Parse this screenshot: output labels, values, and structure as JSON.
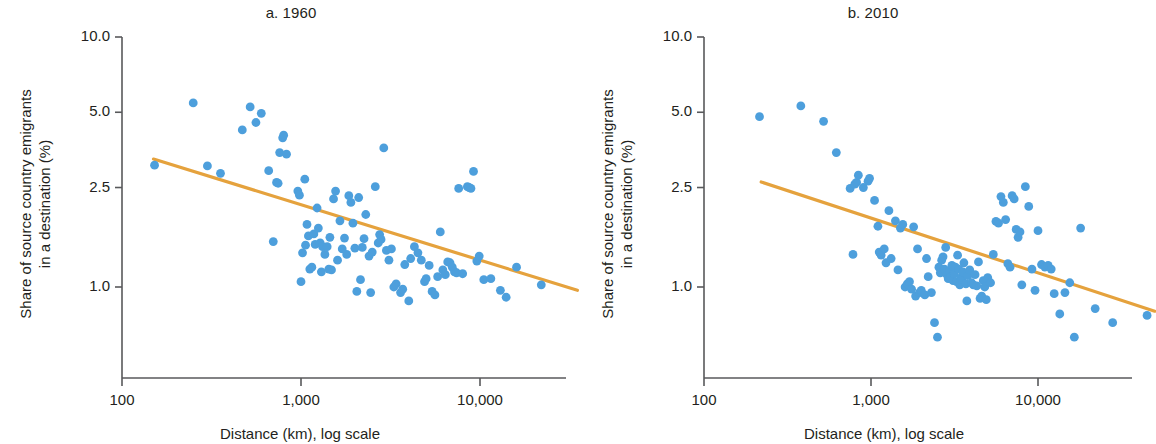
{
  "figure": {
    "background": "#ffffff",
    "point_color": "#4d9fdc",
    "line_color": "#e5a23d",
    "axis_color": "#58595b",
    "text_color": "#231f20"
  },
  "chart_data": [
    {
      "type": "scatter",
      "title": "a. 1960",
      "xlabel": "Distance (km), log scale",
      "ylabel": "Share of source country emigrants in a destination (%)",
      "ylabel_lines": [
        "Share of source country emigrants",
        "in a destination (%)"
      ],
      "xscale": "log",
      "yscale": "log",
      "xlim": [
        100,
        40000
      ],
      "ylim": [
        0.55,
        10.0
      ],
      "xticks": [
        100,
        1000,
        10000
      ],
      "xticklabels": [
        "100",
        "1,000",
        "10,000"
      ],
      "yticks": [
        1.0,
        2.5,
        5.0,
        10.0
      ],
      "yticklabels": [
        "1.0",
        "2.5",
        "5.0",
        "10.0"
      ],
      "grid": false,
      "legend": "none",
      "trendline": {
        "x": [
          150,
          35000
        ],
        "y": [
          3.25,
          0.97
        ]
      },
      "points": [
        [
          152,
          3.07
        ],
        [
          250,
          5.45
        ],
        [
          300,
          3.05
        ],
        [
          355,
          2.85
        ],
        [
          470,
          4.25
        ],
        [
          520,
          5.25
        ],
        [
          560,
          4.55
        ],
        [
          600,
          4.95
        ],
        [
          660,
          2.92
        ],
        [
          700,
          1.52
        ],
        [
          730,
          2.62
        ],
        [
          745,
          2.6
        ],
        [
          760,
          3.45
        ],
        [
          790,
          3.95
        ],
        [
          800,
          4.05
        ],
        [
          830,
          3.4
        ],
        [
          960,
          2.42
        ],
        [
          980,
          2.33
        ],
        [
          1000,
          1.05
        ],
        [
          1020,
          1.37
        ],
        [
          1050,
          2.7
        ],
        [
          1060,
          1.47
        ],
        [
          1080,
          1.78
        ],
        [
          1100,
          1.6
        ],
        [
          1120,
          1.18
        ],
        [
          1150,
          1.2
        ],
        [
          1180,
          1.63
        ],
        [
          1200,
          1.48
        ],
        [
          1230,
          2.07
        ],
        [
          1250,
          1.72
        ],
        [
          1280,
          1.5
        ],
        [
          1300,
          1.15
        ],
        [
          1320,
          1.45
        ],
        [
          1360,
          1.35
        ],
        [
          1400,
          1.45
        ],
        [
          1430,
          1.18
        ],
        [
          1450,
          1.58
        ],
        [
          1480,
          1.17
        ],
        [
          1520,
          2.25
        ],
        [
          1560,
          2.42
        ],
        [
          1600,
          1.28
        ],
        [
          1650,
          1.84
        ],
        [
          1700,
          1.42
        ],
        [
          1750,
          1.57
        ],
        [
          1800,
          1.35
        ],
        [
          1850,
          2.32
        ],
        [
          1900,
          2.18
        ],
        [
          1950,
          1.8
        ],
        [
          2000,
          1.43
        ],
        [
          2050,
          0.96
        ],
        [
          2100,
          2.28
        ],
        [
          2150,
          1.07
        ],
        [
          2200,
          1.44
        ],
        [
          2250,
          1.56
        ],
        [
          2300,
          1.95
        ],
        [
          2400,
          1.33
        ],
        [
          2450,
          0.95
        ],
        [
          2500,
          1.38
        ],
        [
          2600,
          2.52
        ],
        [
          2700,
          1.5
        ],
        [
          2750,
          1.62
        ],
        [
          2800,
          1.55
        ],
        [
          2900,
          3.6
        ],
        [
          3000,
          1.4
        ],
        [
          3100,
          1.28
        ],
        [
          3200,
          1.42
        ],
        [
          3300,
          1.0
        ],
        [
          3400,
          1.03
        ],
        [
          3600,
          0.95
        ],
        [
          3700,
          0.98
        ],
        [
          3800,
          1.23
        ],
        [
          4000,
          0.88
        ],
        [
          4100,
          1.3
        ],
        [
          4300,
          1.45
        ],
        [
          4500,
          1.37
        ],
        [
          4700,
          1.28
        ],
        [
          4900,
          1.05
        ],
        [
          5000,
          1.08
        ],
        [
          5200,
          1.22
        ],
        [
          5400,
          0.96
        ],
        [
          5600,
          0.93
        ],
        [
          5800,
          1.1
        ],
        [
          6000,
          1.66
        ],
        [
          6200,
          1.17
        ],
        [
          6400,
          1.12
        ],
        [
          6600,
          1.26
        ],
        [
          6800,
          1.25
        ],
        [
          7000,
          1.2
        ],
        [
          7200,
          1.15
        ],
        [
          7400,
          1.14
        ],
        [
          7600,
          2.48
        ],
        [
          8000,
          1.13
        ],
        [
          8500,
          2.52
        ],
        [
          8700,
          2.5
        ],
        [
          8900,
          2.48
        ],
        [
          9200,
          2.9
        ],
        [
          9600,
          1.27
        ],
        [
          9900,
          1.33
        ],
        [
          10500,
          1.07
        ],
        [
          11500,
          1.08
        ],
        [
          13000,
          0.97
        ],
        [
          14000,
          0.91
        ],
        [
          16000,
          1.2
        ],
        [
          22000,
          1.02
        ]
      ]
    },
    {
      "type": "scatter",
      "title": "b. 2010",
      "xlabel": "Distance (km), log scale",
      "ylabel": "Share of source country emigrants in a destination (%)",
      "ylabel_lines": [
        "Share of source country emigrants",
        "in a destination (%)"
      ],
      "xscale": "log",
      "yscale": "log",
      "xlim": [
        100,
        60000
      ],
      "ylim": [
        0.55,
        10.0
      ],
      "xticks": [
        100,
        1000,
        10000
      ],
      "xticklabels": [
        "100",
        "1,000",
        "10,000"
      ],
      "yticks": [
        1.0,
        2.5,
        5.0,
        10.0
      ],
      "yticklabels": [
        "1.0",
        "2.5",
        "5.0",
        "10.0"
      ],
      "grid": false,
      "legend": "none",
      "trendline": {
        "x": [
          220,
          50000
        ],
        "y": [
          2.63,
          0.8
        ]
      },
      "points": [
        [
          215,
          4.8
        ],
        [
          380,
          5.3
        ],
        [
          520,
          4.6
        ],
        [
          620,
          3.45
        ],
        [
          750,
          2.48
        ],
        [
          780,
          1.35
        ],
        [
          800,
          2.58
        ],
        [
          820,
          2.62
        ],
        [
          840,
          2.8
        ],
        [
          900,
          2.5
        ],
        [
          960,
          2.65
        ],
        [
          980,
          2.72
        ],
        [
          1050,
          2.22
        ],
        [
          1100,
          1.75
        ],
        [
          1120,
          1.38
        ],
        [
          1150,
          1.34
        ],
        [
          1200,
          1.42
        ],
        [
          1230,
          1.25
        ],
        [
          1280,
          2.02
        ],
        [
          1320,
          1.3
        ],
        [
          1400,
          1.84
        ],
        [
          1450,
          1.17
        ],
        [
          1500,
          1.72
        ],
        [
          1550,
          1.78
        ],
        [
          1600,
          1.0
        ],
        [
          1650,
          1.03
        ],
        [
          1700,
          1.05
        ],
        [
          1750,
          0.98
        ],
        [
          1800,
          1.74
        ],
        [
          1850,
          0.92
        ],
        [
          1900,
          1.42
        ],
        [
          1950,
          0.95
        ],
        [
          2000,
          0.97
        ],
        [
          2100,
          0.93
        ],
        [
          2150,
          1.3
        ],
        [
          2200,
          1.1
        ],
        [
          2300,
          0.95
        ],
        [
          2400,
          0.72
        ],
        [
          2500,
          0.63
        ],
        [
          2550,
          1.2
        ],
        [
          2600,
          1.14
        ],
        [
          2650,
          1.28
        ],
        [
          2700,
          1.32
        ],
        [
          2750,
          1.18
        ],
        [
          2800,
          1.44
        ],
        [
          2850,
          1.12
        ],
        [
          2900,
          1.08
        ],
        [
          2950,
          1.16
        ],
        [
          3000,
          1.1
        ],
        [
          3050,
          1.22
        ],
        [
          3100,
          1.06
        ],
        [
          3150,
          1.13
        ],
        [
          3200,
          1.2
        ],
        [
          3250,
          1.05
        ],
        [
          3300,
          1.34
        ],
        [
          3350,
          1.18
        ],
        [
          3400,
          1.02
        ],
        [
          3450,
          1.09
        ],
        [
          3500,
          1.07
        ],
        [
          3550,
          1.15
        ],
        [
          3600,
          1.25
        ],
        [
          3700,
          1.03
        ],
        [
          3750,
          0.88
        ],
        [
          3800,
          1.11
        ],
        [
          3900,
          1.17
        ],
        [
          4000,
          1.04
        ],
        [
          4100,
          1.02
        ],
        [
          4200,
          1.12
        ],
        [
          4300,
          1.01
        ],
        [
          4400,
          1.26
        ],
        [
          4500,
          0.9
        ],
        [
          4600,
          0.92
        ],
        [
          4700,
          1.06
        ],
        [
          4800,
          1.0
        ],
        [
          4900,
          0.89
        ],
        [
          5000,
          1.09
        ],
        [
          5200,
          1.04
        ],
        [
          5400,
          1.35
        ],
        [
          5600,
          1.83
        ],
        [
          5800,
          1.8
        ],
        [
          6000,
          2.3
        ],
        [
          6200,
          2.18
        ],
        [
          6400,
          1.86
        ],
        [
          6600,
          1.24
        ],
        [
          6800,
          1.2
        ],
        [
          7000,
          2.32
        ],
        [
          7200,
          2.25
        ],
        [
          7400,
          1.7
        ],
        [
          7600,
          1.58
        ],
        [
          7800,
          1.66
        ],
        [
          8000,
          1.02
        ],
        [
          8400,
          2.52
        ],
        [
          8800,
          2.1
        ],
        [
          9200,
          1.18
        ],
        [
          9600,
          0.97
        ],
        [
          10000,
          1.68
        ],
        [
          10500,
          1.23
        ],
        [
          11000,
          1.2
        ],
        [
          11500,
          1.22
        ],
        [
          12000,
          1.18
        ],
        [
          12500,
          0.94
        ],
        [
          13500,
          0.78
        ],
        [
          14500,
          0.95
        ],
        [
          15500,
          1.04
        ],
        [
          16500,
          0.63
        ],
        [
          18000,
          1.72
        ],
        [
          22000,
          0.82
        ],
        [
          28000,
          0.72
        ],
        [
          45000,
          0.77
        ]
      ]
    }
  ]
}
